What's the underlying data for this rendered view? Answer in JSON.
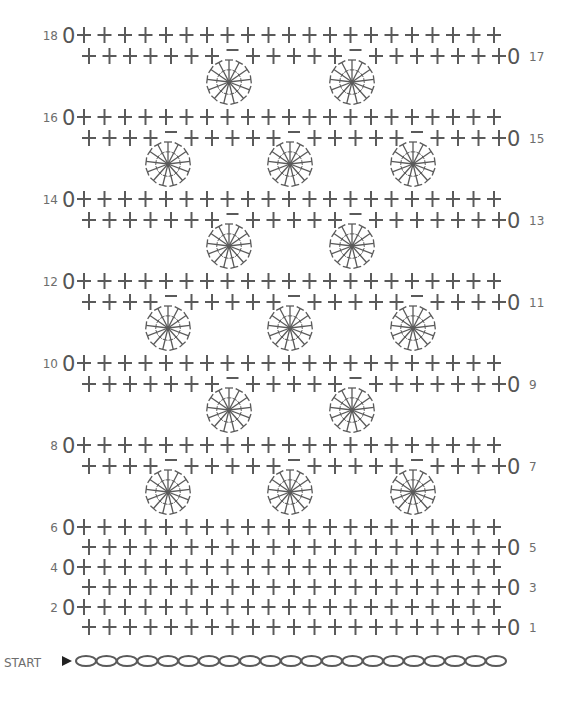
{
  "diagram": {
    "type": "crochet-chart",
    "start_label": "START",
    "stitch_color": "#5a5a5a",
    "label_color": "#6d6d6d",
    "stitch_spacing": 20.5,
    "stitches_per_row": 21,
    "foundation_chain_count": 21,
    "turning_chain_symbol": "0",
    "rows": [
      {
        "num": 18,
        "side": "left",
        "y": 35,
        "gaps": []
      },
      {
        "num": 17,
        "side": "right",
        "y": 56,
        "gaps": [
          7,
          13
        ]
      },
      {
        "num": 16,
        "side": "left",
        "y": 117,
        "gaps": []
      },
      {
        "num": 15,
        "side": "right",
        "y": 138,
        "gaps": [
          4,
          10,
          16
        ]
      },
      {
        "num": 14,
        "side": "left",
        "y": 199,
        "gaps": []
      },
      {
        "num": 13,
        "side": "right",
        "y": 220,
        "gaps": [
          7,
          13
        ]
      },
      {
        "num": 12,
        "side": "left",
        "y": 281,
        "gaps": []
      },
      {
        "num": 11,
        "side": "right",
        "y": 302,
        "gaps": [
          4,
          10,
          16
        ]
      },
      {
        "num": 10,
        "side": "left",
        "y": 363,
        "gaps": []
      },
      {
        "num": 9,
        "side": "right",
        "y": 384,
        "gaps": [
          7,
          13
        ]
      },
      {
        "num": 8,
        "side": "left",
        "y": 445,
        "gaps": []
      },
      {
        "num": 7,
        "side": "right",
        "y": 466,
        "gaps": [
          4,
          10,
          16
        ]
      },
      {
        "num": 6,
        "side": "left",
        "y": 527,
        "gaps": []
      },
      {
        "num": 5,
        "side": "right",
        "y": 547,
        "gaps": []
      },
      {
        "num": 4,
        "side": "left",
        "y": 567,
        "gaps": []
      },
      {
        "num": 3,
        "side": "right",
        "y": 587,
        "gaps": []
      },
      {
        "num": 2,
        "side": "left",
        "y": 607,
        "gaps": []
      },
      {
        "num": 1,
        "side": "right",
        "y": 627,
        "gaps": []
      }
    ],
    "shells": [
      {
        "cx": 229,
        "cy": 82
      },
      {
        "cx": 352,
        "cy": 82
      },
      {
        "cx": 168,
        "cy": 164
      },
      {
        "cx": 290,
        "cy": 164
      },
      {
        "cx": 413,
        "cy": 164
      },
      {
        "cx": 229,
        "cy": 246
      },
      {
        "cx": 352,
        "cy": 246
      },
      {
        "cx": 168,
        "cy": 328
      },
      {
        "cx": 290,
        "cy": 328
      },
      {
        "cx": 413,
        "cy": 328
      },
      {
        "cx": 229,
        "cy": 410
      },
      {
        "cx": 352,
        "cy": 410
      },
      {
        "cx": 168,
        "cy": 492
      },
      {
        "cx": 290,
        "cy": 492
      },
      {
        "cx": 413,
        "cy": 492
      }
    ],
    "shell_spokes": 13,
    "shell_radius": 22,
    "legend_symbols": {
      "plus": "single-crochet",
      "oval": "chain",
      "zero": "turning-chain",
      "shell": "shell-of-double-crochets",
      "dash": "skipped-stitch"
    }
  }
}
